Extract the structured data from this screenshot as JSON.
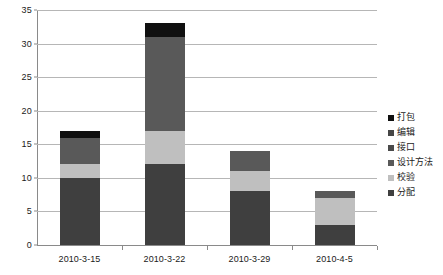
{
  "chart_data": {
    "type": "bar",
    "stacked": true,
    "title": "",
    "xlabel": "",
    "ylabel": "",
    "ylim": [
      0,
      35
    ],
    "ytick_step": 5,
    "yticks": [
      "0",
      "5",
      "10",
      "15",
      "20",
      "25",
      "30",
      "35"
    ],
    "grid": true,
    "legend_position": "right",
    "categories": [
      "2010-3-15",
      "2010-3-22",
      "2010-3-29",
      "2010-4-5"
    ],
    "series": [
      {
        "name": "分配",
        "color": "#3f3f3f",
        "values": [
          10,
          12,
          8,
          3
        ]
      },
      {
        "name": "校验",
        "color": "#bfbfbf",
        "values": [
          2,
          5,
          3,
          4
        ]
      },
      {
        "name": "设计方法",
        "color": "#595959",
        "values": [
          4,
          14,
          3,
          1
        ]
      },
      {
        "name": "接口",
        "color": "#4a4a4a",
        "values": [
          0,
          0,
          0,
          0
        ]
      },
      {
        "name": "编辑",
        "color": "#464646",
        "values": [
          0,
          0,
          0,
          0
        ]
      },
      {
        "name": "打包",
        "color": "#101010",
        "values": [
          1,
          2,
          0,
          0
        ]
      }
    ],
    "totals": [
      17,
      33,
      14,
      8
    ],
    "legend_entries": [
      {
        "label": "打包",
        "color": "#101010"
      },
      {
        "label": "编辑",
        "color": "#464646"
      },
      {
        "label": "接口",
        "color": "#4a4a4a"
      },
      {
        "label": "设计方法",
        "color": "#595959"
      },
      {
        "label": "校验",
        "color": "#bfbfbf"
      },
      {
        "label": "分配",
        "color": "#3f3f3f"
      }
    ]
  }
}
